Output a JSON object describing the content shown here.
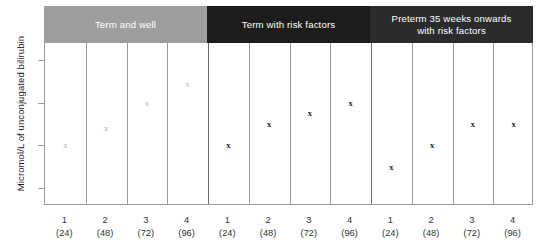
{
  "chart_data": {
    "type": "scatter",
    "title": "",
    "xlabel": "",
    "ylabel": "Micromol/L of unconjugated bilirubin",
    "ylim": [
      60,
      440
    ],
    "yticks": [
      100,
      200,
      300,
      400
    ],
    "grid": false,
    "legend": "none",
    "categories": [
      "1 (24)",
      "2 (48)",
      "3 (72)",
      "4 (96)",
      "1 (24)",
      "2 (48)",
      "3 (72)",
      "4 (96)",
      "1 (24)",
      "2 (48)",
      "3 (72)",
      "4 (96)"
    ],
    "groups": [
      {
        "label": "Term and well",
        "band_color": "#9e9e9e",
        "marker_color": "#b3b3b3",
        "points": [
          {
            "x": "1",
            "hours": "(24)",
            "y": 200
          },
          {
            "x": "2",
            "hours": "(48)",
            "y": 240
          },
          {
            "x": "3",
            "hours": "(72)",
            "y": 300
          },
          {
            "x": "4",
            "hours": "(96)",
            "y": 345
          }
        ]
      },
      {
        "label": "Term with risk factors",
        "band_color": "#1c1c1c",
        "marker_color": "#1a1a1a",
        "points": [
          {
            "x": "1",
            "hours": "(24)",
            "y": 200
          },
          {
            "x": "2",
            "hours": "(48)",
            "y": 250
          },
          {
            "x": "3",
            "hours": "(72)",
            "y": 275
          },
          {
            "x": "4",
            "hours": "(96)",
            "y": 300
          }
        ]
      },
      {
        "label": "Preterm 35 weeks onwards with risk factors",
        "label_line1": "Preterm 35 weeks onwards",
        "label_line2": "with risk factors",
        "band_color": "#2b2b2b",
        "marker_color": "#1a1a1a",
        "points": [
          {
            "x": "1",
            "hours": "(24)",
            "y": 150
          },
          {
            "x": "2",
            "hours": "(48)",
            "y": 200
          },
          {
            "x": "3",
            "hours": "(72)",
            "y": 250
          },
          {
            "x": "4",
            "hours": "(96)",
            "y": 250
          }
        ]
      }
    ],
    "marker_glyph": "x"
  },
  "colors": {
    "band_light": "#9e9e9e",
    "band_dark": "#1c1c1c",
    "band_dark2": "#2b2b2b",
    "axis": "#9a9a9a",
    "text": "#333333",
    "marker_light": "#b3b3b3",
    "marker_dark": "#1a1a1a"
  }
}
